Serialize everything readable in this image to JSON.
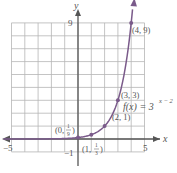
{
  "chart_data": {
    "type": "line",
    "title": "",
    "function_label": "f(x) = 3^(x−2)",
    "function_label_parts": {
      "lhs": "f(x) = 3",
      "exp": "x − 2"
    },
    "xlabel": "x",
    "ylabel": "y",
    "xlim": [
      -5,
      5
    ],
    "ylim": [
      -1,
      9
    ],
    "grid": true,
    "x_ticks_labeled": [
      "−5",
      "5"
    ],
    "y_ticks_labeled": [
      "−1",
      "9"
    ],
    "points": [
      {
        "x": 0,
        "y": 0.1111,
        "label": "(0, 1/9)"
      },
      {
        "x": 1,
        "y": 0.3333,
        "label": "(1, 1/3)"
      },
      {
        "x": 2,
        "y": 1,
        "label": "(2, 1)"
      },
      {
        "x": 3,
        "y": 3,
        "label": "(3, 3)"
      },
      {
        "x": 4,
        "y": 9,
        "label": "(4, 9)"
      }
    ],
    "series": [
      {
        "name": "f(x) = 3^(x−2)",
        "color": "#7a5a8a"
      }
    ]
  },
  "colors": {
    "grid": "#b5b5b5",
    "axis": "#555555",
    "curve": "#7a5a8a",
    "text": "#555555"
  },
  "labels": {
    "x_axis": "x",
    "y_axis": "y",
    "x_min": "−5",
    "x_max": "5",
    "y_min": "−1",
    "y_max": "9",
    "pt0_pre": "(0, ",
    "pt0_num": "1",
    "pt0_den": "9",
    "pt0_post": ")",
    "pt1_pre": "(1, ",
    "pt1_num": "1",
    "pt1_den": "3",
    "pt1_post": ")",
    "pt2": "(2, 1)",
    "pt3": "(3, 3)",
    "pt4": "(4, 9)",
    "fn_lhs": "f(x) = 3",
    "fn_exp": "x − 2"
  }
}
